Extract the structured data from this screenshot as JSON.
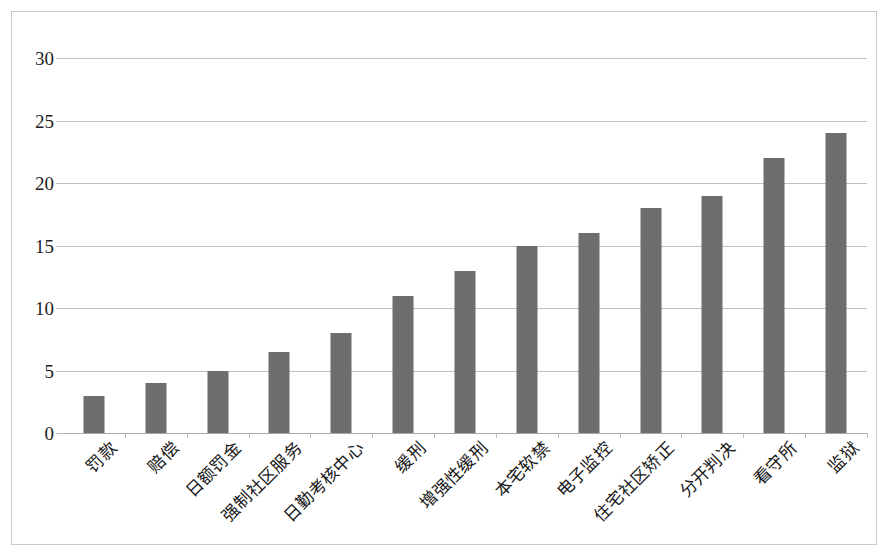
{
  "figure": {
    "background_color": "#ffffff",
    "border_color": "#c9c9c9",
    "bar_color": "#6e6e6e",
    "grid_color": "#c0c0c0"
  },
  "chart_data": {
    "type": "bar",
    "title": "",
    "subtitle": "",
    "xlabel": "",
    "ylabel": "",
    "ylim": [
      0,
      30
    ],
    "ytick_values": [
      0,
      5,
      10,
      15,
      20,
      25,
      30
    ],
    "ytick_labels": [
      "0",
      "5",
      "10",
      "15",
      "20",
      "25",
      "30"
    ],
    "grid": "horizontal",
    "legend": "none",
    "categories": [
      "罚款",
      "赔偿",
      "日额罚金",
      "强制社区服务",
      "日勤考核中心",
      "缓刑",
      "增强性缓刑",
      "本宅软禁",
      "电子监控",
      "住宅社区矫正",
      "分开判决",
      "看守所",
      "监狱"
    ],
    "values": [
      3,
      4,
      5,
      6.5,
      8,
      11,
      13,
      15,
      16,
      18,
      19,
      22,
      24
    ],
    "series": [
      {
        "name": "",
        "values": [
          3,
          4,
          5,
          6.5,
          8,
          11,
          13,
          15,
          16,
          18,
          19,
          22,
          24
        ]
      }
    ]
  }
}
